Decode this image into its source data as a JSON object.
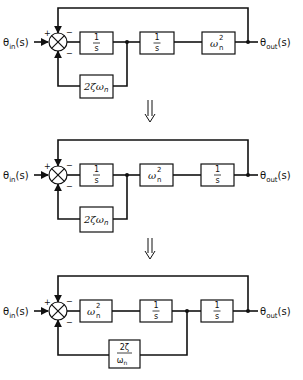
{
  "figure": {
    "transform_arrow": "⇓"
  },
  "signals": {
    "input": {
      "base": "θ",
      "sub": "in",
      "arg": "(s)"
    },
    "output": {
      "base": "θ",
      "sub": "out",
      "arg": "(s)"
    }
  },
  "summing_junction": {
    "signs": {
      "input": "+",
      "top": "−",
      "bottom": "−"
    }
  },
  "diagrams": [
    {
      "forward_blocks": [
        {
          "type": "fraction",
          "num": "1",
          "den": "s"
        },
        {
          "type": "fraction",
          "num": "1",
          "den": "s"
        },
        {
          "type": "power",
          "base": "ω",
          "sub": "n",
          "sup": "2"
        }
      ],
      "feedback_block": {
        "type": "text",
        "text": "2ζω",
        "sub": "n"
      },
      "feedback_tap_after_block": 1
    },
    {
      "forward_blocks": [
        {
          "type": "fraction",
          "num": "1",
          "den": "s"
        },
        {
          "type": "power",
          "base": "ω",
          "sub": "n",
          "sup": "2"
        },
        {
          "type": "fraction",
          "num": "1",
          "den": "s"
        }
      ],
      "feedback_block": {
        "type": "text",
        "text": "2ζω",
        "sub": "n"
      },
      "feedback_tap_after_block": 1
    },
    {
      "forward_blocks": [
        {
          "type": "power",
          "base": "ω",
          "sub": "n",
          "sup": "2"
        },
        {
          "type": "fraction",
          "num": "1",
          "den": "s"
        },
        {
          "type": "fraction",
          "num": "1",
          "den": "s"
        }
      ],
      "feedback_block": {
        "type": "fraction",
        "num": "2ζ",
        "den": "ω",
        "den_sub": "n"
      },
      "feedback_tap_after_block": 2
    }
  ]
}
